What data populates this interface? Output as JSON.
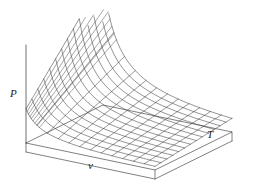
{
  "figure": {
    "title": "",
    "caption": "",
    "background_color": "#ffffff",
    "line_color": "#3c3c3c",
    "axis_color": "#4a4a4a",
    "label_color": "#1a1a1a"
  },
  "axes": {
    "vertical": {
      "name": "P-axis",
      "label": "P"
    },
    "left_horizontal": {
      "name": "v-axis",
      "label": "v"
    },
    "right_horizontal": {
      "name": "T-axis",
      "label": "T"
    }
  },
  "chart_data": {
    "type": "line",
    "title": "",
    "subtitle": "",
    "xlabel": "v",
    "ylabel": "P",
    "zlabel": "T",
    "surface_function": "P = R*T/v",
    "projection": "3d-wireframe-mesh",
    "grid": false,
    "legend": false,
    "legend_position": "none",
    "xlim": [
      0.28,
      2.6
    ],
    "ylim": [
      0,
      3.6
    ],
    "zlim": [
      0.35,
      1.3
    ],
    "n_v_lines": 13,
    "n_T_lines": 14,
    "constant_R": 1.0,
    "v_values": [
      0.28,
      0.4,
      0.55,
      0.72,
      0.9,
      1.08,
      1.28,
      1.48,
      1.7,
      1.92,
      2.15,
      2.38,
      2.6
    ],
    "T_values": [
      0.35,
      0.42,
      0.49,
      0.56,
      0.63,
      0.71,
      0.78,
      0.85,
      0.92,
      0.99,
      1.06,
      1.14,
      1.21,
      1.3
    ],
    "series": [
      {
        "name": "isotherm T=0.35",
        "x": [
          0.28,
          0.4,
          0.55,
          0.72,
          0.9,
          1.08,
          1.28,
          1.48,
          1.7,
          1.92,
          2.15,
          2.38,
          2.6
        ],
        "values": [
          1.25,
          0.875,
          0.636,
          0.486,
          0.389,
          0.324,
          0.273,
          0.236,
          0.206,
          0.182,
          0.163,
          0.147,
          0.135
        ]
      },
      {
        "name": "isotherm T=0.63",
        "x": [
          0.28,
          0.4,
          0.55,
          0.72,
          0.9,
          1.08,
          1.28,
          1.48,
          1.7,
          1.92,
          2.15,
          2.38,
          2.6
        ],
        "values": [
          2.25,
          1.575,
          1.145,
          0.875,
          0.7,
          0.583,
          0.492,
          0.426,
          0.371,
          0.328,
          0.293,
          0.265,
          0.242
        ]
      },
      {
        "name": "isotherm T=0.92",
        "x": [
          0.28,
          0.4,
          0.55,
          0.72,
          0.9,
          1.08,
          1.28,
          1.48,
          1.7,
          1.92,
          2.15,
          2.38,
          2.6
        ],
        "values": [
          3.29,
          2.3,
          1.673,
          1.278,
          1.022,
          0.852,
          0.719,
          0.622,
          0.541,
          0.479,
          0.428,
          0.387,
          0.354
        ]
      },
      {
        "name": "isotherm T=1.3",
        "x": [
          0.28,
          0.4,
          0.55,
          0.72,
          0.9,
          1.08,
          1.28,
          1.48,
          1.7,
          1.92,
          2.15,
          2.38,
          2.6
        ],
        "values": [
          4.64,
          3.25,
          2.364,
          1.806,
          1.444,
          1.204,
          1.016,
          0.878,
          0.765,
          0.677,
          0.605,
          0.546,
          0.5
        ]
      }
    ],
    "annotations": []
  },
  "base_slab": {
    "name": "base-slab",
    "visible": true,
    "thickness_px": 9
  }
}
